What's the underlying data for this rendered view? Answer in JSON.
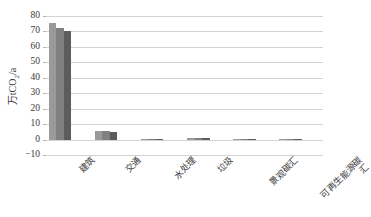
{
  "chart_data": {
    "type": "bar",
    "title": "",
    "xlabel": "",
    "ylabel": "万tCO2/a",
    "ylabel_parts": {
      "prefix": "万tCO",
      "sub": "2",
      "suffix": "/a"
    },
    "categories": [
      "建筑",
      "交通",
      "水处理",
      "垃圾",
      "景观碳汇",
      "可再生能源碳汇"
    ],
    "series": [
      {
        "name": "series-1",
        "color": "#9a9a9a",
        "values": [
          75.5,
          5.5,
          0.6,
          0.9,
          0.5,
          0.6
        ]
      },
      {
        "name": "series-2",
        "color": "#808080",
        "values": [
          72.5,
          5.3,
          0.6,
          0.9,
          0.5,
          0.6
        ]
      },
      {
        "name": "series-3",
        "color": "#5c5c5c",
        "values": [
          70.0,
          5.2,
          0.6,
          0.9,
          0.5,
          0.6
        ]
      }
    ],
    "yticks": [
      80,
      70,
      60,
      50,
      40,
      30,
      20,
      10,
      0,
      -10
    ],
    "ylim": [
      -10,
      80
    ],
    "grid": "horizontal",
    "legend": "none",
    "gridline_color": "#d3d3d3",
    "background": "#ffffff",
    "text_color": "#3a3a3a"
  }
}
